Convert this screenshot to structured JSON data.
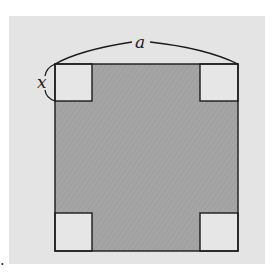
{
  "diagram": {
    "labels": {
      "side": "a",
      "corner": "x",
      "trailing_mark": "."
    },
    "colors": {
      "background": "#e4e4e4",
      "shaded_region": "#a3a3a3",
      "corner_squares": "#e6e6e6",
      "stroke": "#1a1a1a"
    },
    "outer_square": {
      "x": 55,
      "y": 64,
      "size": 183
    },
    "corner_square_size": 37
  }
}
